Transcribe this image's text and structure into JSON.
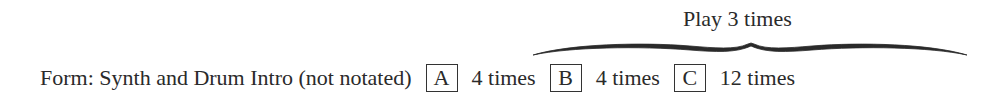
{
  "repeat_annotation": {
    "label": "Play 3 times",
    "spans_sections": [
      "A",
      "B",
      "C"
    ]
  },
  "form": {
    "label": "Form: Synth and Drum Intro (not notated)",
    "sections": [
      {
        "letter": "A",
        "repetitions": "4 times"
      },
      {
        "letter": "B",
        "repetitions": "4 times"
      },
      {
        "letter": "C",
        "repetitions": "12 times"
      }
    ]
  }
}
